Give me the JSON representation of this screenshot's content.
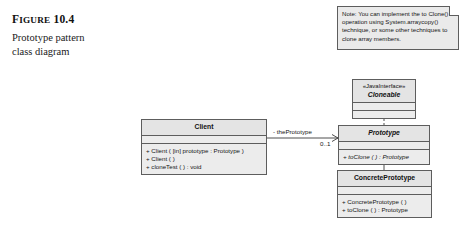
{
  "figure": {
    "label_prefix": "F",
    "label_rest": "IGURE",
    "label_number": "10.4",
    "caption_line1": "Prototype pattern",
    "caption_line2": "class diagram"
  },
  "note": {
    "text": "Note: You can implement the to Clone() operation using System.arraycopy() technique, or some other techniques to clone array members."
  },
  "classes": {
    "cloneable": {
      "stereotype": "«JavaInterface»",
      "name": "Cloneable"
    },
    "prototype": {
      "name": "Prototype",
      "operations": [
        "+ toClone ( ) : Prototype"
      ]
    },
    "concrete_prototype": {
      "name": "ConcretePrototype",
      "operations": [
        "+ ConcretePrototype ( )",
        "+ toClone ( ) : Prototype"
      ]
    },
    "client": {
      "name": "Client",
      "operations": [
        "+ Client ( [in] prototype : Prototype )",
        "+ Client ( )",
        "+ cloneTest ( ) : void"
      ]
    }
  },
  "association": {
    "role_name": "- thePrototype",
    "multiplicity": "0..1"
  },
  "colors": {
    "box_fill": "#ececec",
    "box_border": "#5d5d5d",
    "note_fill": "#eaeaea",
    "line": "#3a3a3a",
    "page_background": "#ffffff"
  }
}
